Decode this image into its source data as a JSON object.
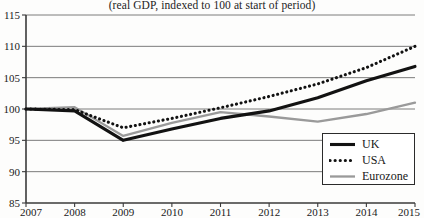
{
  "figure": {
    "subtitle": "(real GDP, indexed to 100 at start of period)",
    "background_color": "#fdfdfc"
  },
  "legend": {
    "position": "bottom-right",
    "entries": [
      {
        "label": "UK",
        "color": "#121212",
        "style": "solid-thick",
        "swatch_name": "legend-swatch-uk"
      },
      {
        "label": "USA",
        "color": "#121212",
        "style": "dotted",
        "swatch_name": "legend-swatch-usa"
      },
      {
        "label": "Eurozone",
        "color": "#9a9a9a",
        "style": "solid-thin",
        "swatch_name": "legend-swatch-eurozone"
      }
    ]
  },
  "chart_data": {
    "type": "line",
    "title": "",
    "subtitle": "(real GDP, indexed to 100 at start of period)",
    "xlabel": "",
    "ylabel": "",
    "x": [
      2007,
      2008,
      2009,
      2010,
      2011,
      2012,
      2013,
      2014,
      2015
    ],
    "categories": [
      "2007",
      "2008",
      "2009",
      "2010",
      "2011",
      "2012",
      "2013",
      "2014",
      "2015"
    ],
    "xlim": [
      2007,
      2015
    ],
    "ylim": [
      85,
      115
    ],
    "yticks": [
      85,
      90,
      95,
      100,
      105,
      110,
      115
    ],
    "xticks": [
      2007,
      2008,
      2009,
      2010,
      2011,
      2012,
      2013,
      2014,
      2015
    ],
    "grid": true,
    "grid_axis": "y",
    "legend_position": "lower right",
    "series": [
      {
        "name": "UK",
        "color": "#121212",
        "style": "solid",
        "values": [
          100.0,
          99.7,
          95.0,
          96.8,
          98.5,
          99.7,
          101.8,
          104.5,
          106.8
        ]
      },
      {
        "name": "USA",
        "color": "#121212",
        "style": "dotted",
        "values": [
          100.0,
          99.9,
          97.0,
          98.5,
          100.2,
          102.0,
          104.0,
          106.6,
          110.0
        ]
      },
      {
        "name": "Eurozone",
        "color": "#9a9a9a",
        "style": "solid",
        "values": [
          100.0,
          100.3,
          95.7,
          97.8,
          99.5,
          98.8,
          98.0,
          99.2,
          101.0
        ]
      }
    ]
  }
}
